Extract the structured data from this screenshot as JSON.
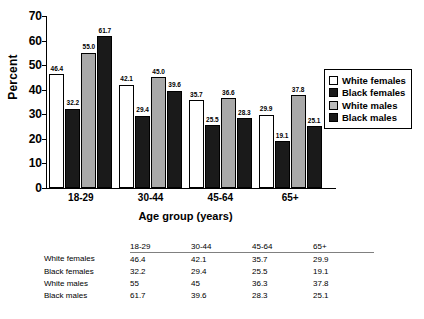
{
  "chart_data": {
    "type": "bar",
    "title": "",
    "xlabel": "Age group (years)",
    "ylabel": "Percent",
    "categories": [
      "18-29",
      "30-44",
      "45-64",
      "65+"
    ],
    "ylim": [
      0,
      70
    ],
    "yticks": [
      0,
      10,
      20,
      30,
      40,
      50,
      60,
      70
    ],
    "grid": false,
    "legend_position": "right",
    "series": [
      {
        "name": "White females",
        "values": [
          46.4,
          42.1,
          35.7,
          29.9
        ],
        "labels": [
          "46.4",
          "42.1",
          "35.7",
          "29.9"
        ],
        "color": "#ffffff"
      },
      {
        "name": "Black females",
        "values": [
          32.2,
          29.4,
          25.5,
          19.1
        ],
        "labels": [
          "32.2",
          "29.4",
          "25.5",
          "19.1"
        ],
        "color": "#1a1a1a"
      },
      {
        "name": "White males",
        "values": [
          55.0,
          45.0,
          36.6,
          37.8
        ],
        "labels": [
          "55.0",
          "45.0",
          "36.6",
          "37.8"
        ],
        "color": "#a9a9a9"
      },
      {
        "name": "Black males",
        "values": [
          61.7,
          39.6,
          28.3,
          25.1
        ],
        "labels": [
          "61.7",
          "39.6",
          "28.3",
          "25.1"
        ],
        "color": "#1a1a1a"
      }
    ]
  },
  "axis": {
    "ytick_0": "0",
    "ytick_1": "10",
    "ytick_2": "20",
    "ytick_3": "30",
    "ytick_4": "40",
    "ytick_5": "50",
    "ytick_6": "60",
    "ytick_7": "70",
    "ylabel": "Percent",
    "xlabel": "Age group (years)",
    "xtick_0": "18-29",
    "xtick_1": "30-44",
    "xtick_2": "45-64",
    "xtick_3": "65+"
  },
  "legend": {
    "items": [
      {
        "label": "White females"
      },
      {
        "label": "Black females"
      },
      {
        "label": "White males"
      },
      {
        "label": "Black males"
      }
    ]
  },
  "table": {
    "corner": "",
    "columns": [
      "18-29",
      "30-44",
      "45-64",
      "65+"
    ],
    "rows": [
      {
        "label": "White females",
        "cells": [
          "46.4",
          "42.1",
          "35.7",
          "29.9"
        ]
      },
      {
        "label": "Black females",
        "cells": [
          "32.2",
          "29.4",
          "25.5",
          "19.1"
        ]
      },
      {
        "label": "White males",
        "cells": [
          "55",
          "45",
          "36.3",
          "37.8"
        ]
      },
      {
        "label": "Black males",
        "cells": [
          "61.7",
          "39.6",
          "28.3",
          "25.1"
        ]
      }
    ]
  }
}
